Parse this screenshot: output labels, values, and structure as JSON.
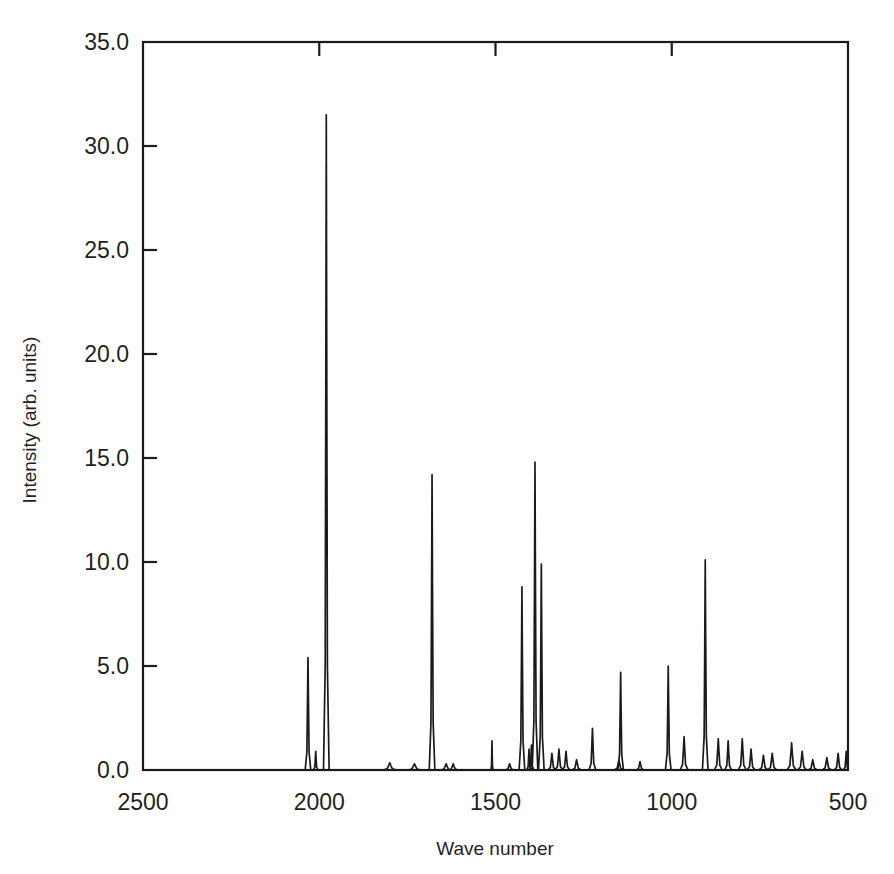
{
  "chart_data": {
    "type": "line",
    "title": "",
    "xlabel": "Wave number",
    "ylabel": "Intensity (arb. units)",
    "xlim": [
      2500,
      500
    ],
    "ylim": [
      0.0,
      35.0
    ],
    "x_reversed": true,
    "grid": false,
    "legend": "none",
    "xticks": [
      2500,
      2000,
      1500,
      1000,
      500
    ],
    "xtick_labels": [
      "2500",
      "2000",
      "1500",
      "1000",
      "500"
    ],
    "yticks": [
      0.0,
      5.0,
      10.0,
      15.0,
      20.0,
      25.0,
      30.0,
      35.0
    ],
    "ytick_labels": [
      "0.0",
      "5.0",
      "10.0",
      "15.0",
      "20.0",
      "25.0",
      "30.0",
      "35.0"
    ],
    "series": [
      {
        "name": "spectrum",
        "color": "#1a1a1a",
        "peaks": [
          {
            "x": 2032,
            "y": 5.4,
            "w": 5
          },
          {
            "x": 2010,
            "y": 0.9,
            "w": 4
          },
          {
            "x": 1980,
            "y": 31.5,
            "w": 5
          },
          {
            "x": 1800,
            "y": 0.35,
            "w": 12
          },
          {
            "x": 1730,
            "y": 0.3,
            "w": 12
          },
          {
            "x": 1680,
            "y": 14.2,
            "w": 5
          },
          {
            "x": 1640,
            "y": 0.3,
            "w": 10
          },
          {
            "x": 1620,
            "y": 0.3,
            "w": 9
          },
          {
            "x": 1510,
            "y": 1.4,
            "w": 2
          },
          {
            "x": 1460,
            "y": 0.3,
            "w": 8
          },
          {
            "x": 1425,
            "y": 8.8,
            "w": 5
          },
          {
            "x": 1405,
            "y": 1.0,
            "w": 4
          },
          {
            "x": 1398,
            "y": 1.2,
            "w": 4
          },
          {
            "x": 1388,
            "y": 14.8,
            "w": 5
          },
          {
            "x": 1370,
            "y": 9.9,
            "w": 5
          },
          {
            "x": 1340,
            "y": 0.8,
            "w": 7
          },
          {
            "x": 1320,
            "y": 1.0,
            "w": 7
          },
          {
            "x": 1300,
            "y": 0.9,
            "w": 7
          },
          {
            "x": 1270,
            "y": 0.5,
            "w": 8
          },
          {
            "x": 1225,
            "y": 2.0,
            "w": 6
          },
          {
            "x": 1150,
            "y": 0.5,
            "w": 8
          },
          {
            "x": 1145,
            "y": 4.7,
            "w": 5
          },
          {
            "x": 1090,
            "y": 0.4,
            "w": 7
          },
          {
            "x": 1010,
            "y": 5.0,
            "w": 5
          },
          {
            "x": 965,
            "y": 1.6,
            "w": 7
          },
          {
            "x": 905,
            "y": 10.1,
            "w": 5
          },
          {
            "x": 868,
            "y": 1.5,
            "w": 7
          },
          {
            "x": 840,
            "y": 1.4,
            "w": 6
          },
          {
            "x": 800,
            "y": 1.5,
            "w": 7
          },
          {
            "x": 775,
            "y": 1.0,
            "w": 7
          },
          {
            "x": 740,
            "y": 0.7,
            "w": 8
          },
          {
            "x": 715,
            "y": 0.8,
            "w": 8
          },
          {
            "x": 660,
            "y": 1.3,
            "w": 8
          },
          {
            "x": 630,
            "y": 0.9,
            "w": 8
          },
          {
            "x": 600,
            "y": 0.5,
            "w": 8
          },
          {
            "x": 560,
            "y": 0.6,
            "w": 8
          },
          {
            "x": 528,
            "y": 0.8,
            "w": 7
          },
          {
            "x": 505,
            "y": 0.9,
            "w": 5
          }
        ],
        "baseline": 0.0
      }
    ]
  },
  "axes": {
    "x_label": "Wave number",
    "y_label": "Intensity (arb. units)"
  }
}
